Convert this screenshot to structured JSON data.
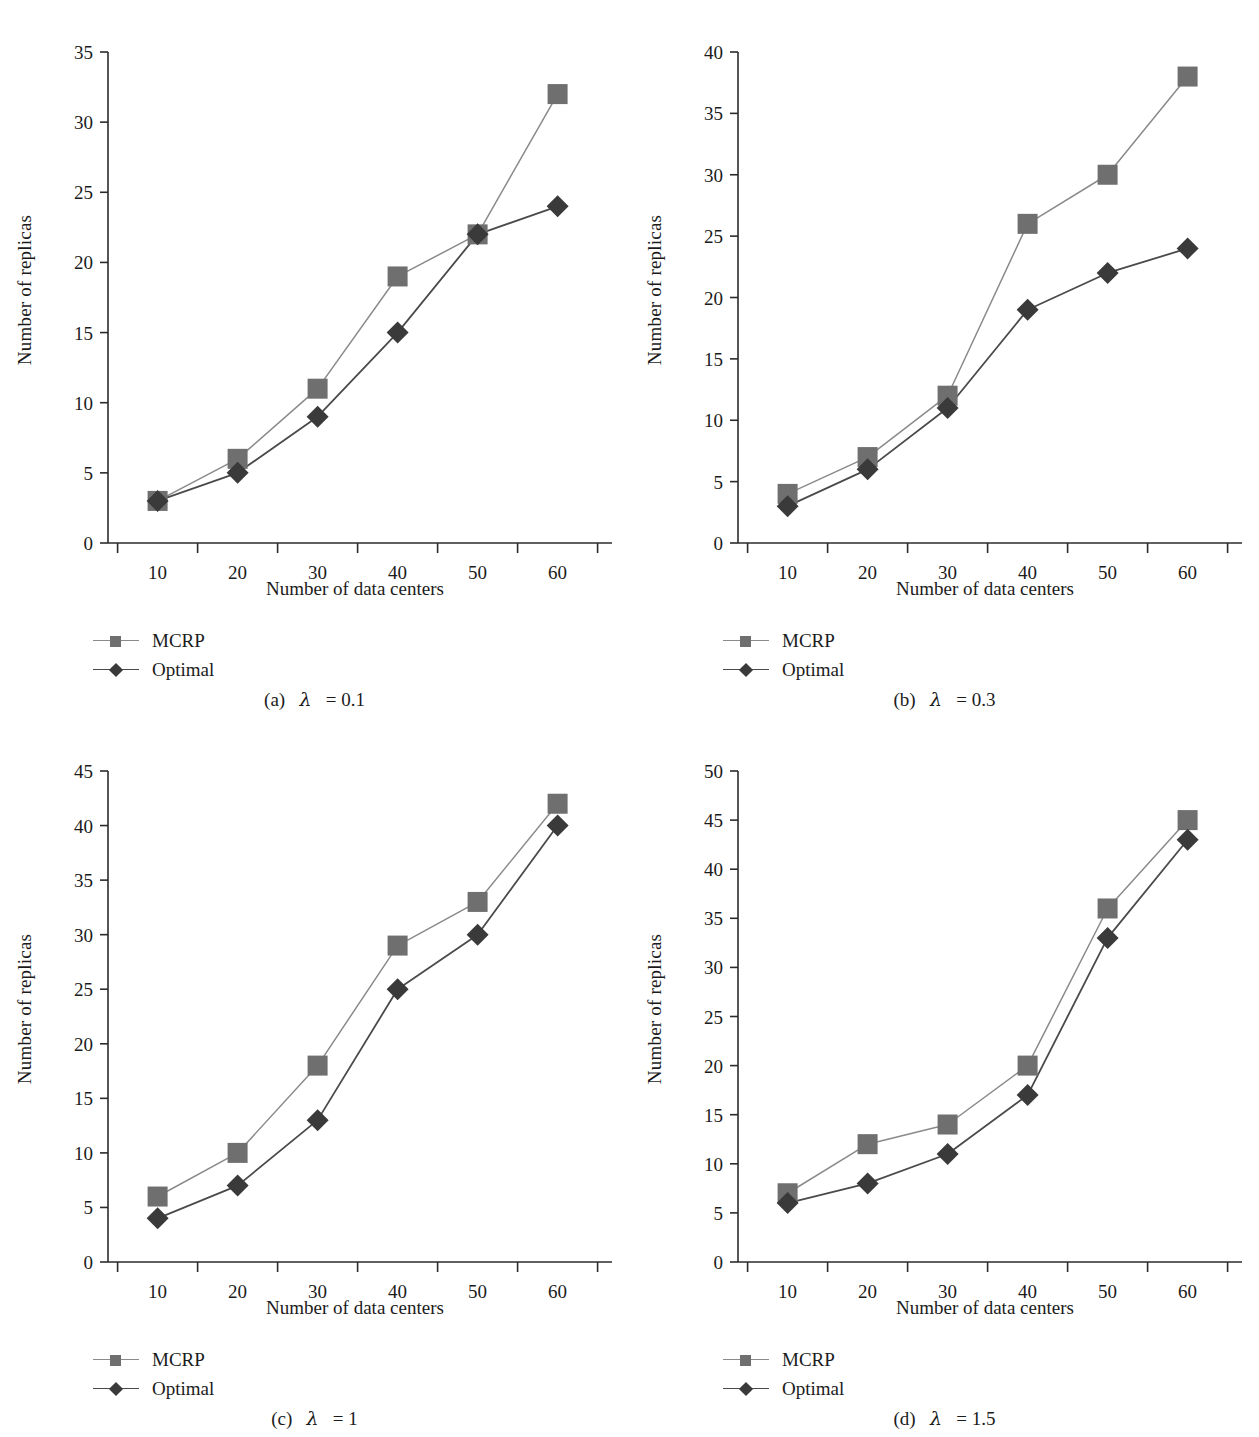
{
  "figure": {
    "panel_count": 4,
    "shared_xlabel": "Number of data centers",
    "shared_ylabel": "Number of replicas",
    "series_names": [
      "MCRP",
      "Optimal"
    ],
    "colors": {
      "mcrp_marker": "#6f6f6f",
      "mcrp_line": "#8a8a8a",
      "optimal_marker": "#3a3a3a",
      "optimal_line": "#4a4a4a",
      "axis": "#2b2b2b",
      "text": "#1b1b1b",
      "background": "#ffffff"
    }
  },
  "chart_data": [
    {
      "id": "panel-a",
      "type": "line",
      "title": "",
      "caption": "(a)  λ = 0.1",
      "caption_prefix": "(a)",
      "caption_lambda": "λ",
      "caption_value": "= 0.1",
      "xlabel": "Number of data centers",
      "ylabel": "Number of replicas",
      "categories": [
        10,
        20,
        30,
        40,
        50,
        60
      ],
      "xticklabels": [
        "10",
        "20",
        "30",
        "40",
        "50",
        "60"
      ],
      "yticks": [
        0,
        5,
        10,
        15,
        20,
        25,
        30,
        35
      ],
      "yticklabels": [
        "0",
        "5",
        "10",
        "15",
        "20",
        "25",
        "30",
        "35"
      ],
      "ylim": [
        0,
        35
      ],
      "grid": false,
      "legend_position": "below-left",
      "series": [
        {
          "name": "MCRP",
          "marker": "square",
          "values": [
            3,
            6,
            11,
            19,
            22,
            32
          ]
        },
        {
          "name": "Optimal",
          "marker": "diamond",
          "values": [
            3,
            5,
            9,
            15,
            22,
            24
          ]
        }
      ]
    },
    {
      "id": "panel-b",
      "type": "line",
      "title": "",
      "caption": "(b)  λ = 0.3",
      "caption_prefix": "(b)",
      "caption_lambda": "λ",
      "caption_value": "= 0.3",
      "xlabel": "Number of data centers",
      "ylabel": "Number of replicas",
      "categories": [
        10,
        20,
        30,
        40,
        50,
        60
      ],
      "xticklabels": [
        "10",
        "20",
        "30",
        "40",
        "50",
        "60"
      ],
      "yticks": [
        0,
        5,
        10,
        15,
        20,
        25,
        30,
        35,
        40
      ],
      "yticklabels": [
        "0",
        "5",
        "10",
        "15",
        "20",
        "25",
        "30",
        "35",
        "40"
      ],
      "ylim": [
        0,
        40
      ],
      "grid": false,
      "legend_position": "below-left",
      "series": [
        {
          "name": "MCRP",
          "marker": "square",
          "values": [
            4,
            7,
            12,
            26,
            30,
            38
          ]
        },
        {
          "name": "Optimal",
          "marker": "diamond",
          "values": [
            3,
            6,
            11,
            19,
            22,
            24
          ]
        }
      ]
    },
    {
      "id": "panel-c",
      "type": "line",
      "title": "",
      "caption": "(c)  λ = 1",
      "caption_prefix": "(c)",
      "caption_lambda": "λ",
      "caption_value": "= 1",
      "xlabel": "Number of data centers",
      "ylabel": "Number of replicas",
      "categories": [
        10,
        20,
        30,
        40,
        50,
        60
      ],
      "xticklabels": [
        "10",
        "20",
        "30",
        "40",
        "50",
        "60"
      ],
      "yticks": [
        0,
        5,
        10,
        15,
        20,
        25,
        30,
        35,
        40,
        45
      ],
      "yticklabels": [
        "0",
        "5",
        "10",
        "15",
        "20",
        "25",
        "30",
        "35",
        "40",
        "45"
      ],
      "ylim": [
        0,
        45
      ],
      "grid": false,
      "legend_position": "below-left",
      "series": [
        {
          "name": "MCRP",
          "marker": "square",
          "values": [
            6,
            10,
            18,
            29,
            33,
            42
          ]
        },
        {
          "name": "Optimal",
          "marker": "diamond",
          "values": [
            4,
            7,
            13,
            25,
            30,
            40
          ]
        }
      ]
    },
    {
      "id": "panel-d",
      "type": "line",
      "title": "",
      "caption": "(d)  λ = 1.5",
      "caption_prefix": "(d)",
      "caption_lambda": "λ",
      "caption_value": "= 1.5",
      "xlabel": "Number of data centers",
      "ylabel": "Number of replicas",
      "categories": [
        10,
        20,
        30,
        40,
        50,
        60
      ],
      "xticklabels": [
        "10",
        "20",
        "30",
        "40",
        "50",
        "60"
      ],
      "yticks": [
        0,
        5,
        10,
        15,
        20,
        25,
        30,
        35,
        40,
        45,
        50
      ],
      "yticklabels": [
        "0",
        "5",
        "10",
        "15",
        "20",
        "25",
        "30",
        "35",
        "40",
        "45",
        "50"
      ],
      "ylim": [
        0,
        50
      ],
      "grid": false,
      "legend_position": "below-left",
      "series": [
        {
          "name": "MCRP",
          "marker": "square",
          "values": [
            7,
            12,
            14,
            20,
            36,
            45
          ]
        },
        {
          "name": "Optimal",
          "marker": "diamond",
          "values": [
            6,
            8,
            11,
            17,
            33,
            43
          ]
        }
      ]
    }
  ]
}
